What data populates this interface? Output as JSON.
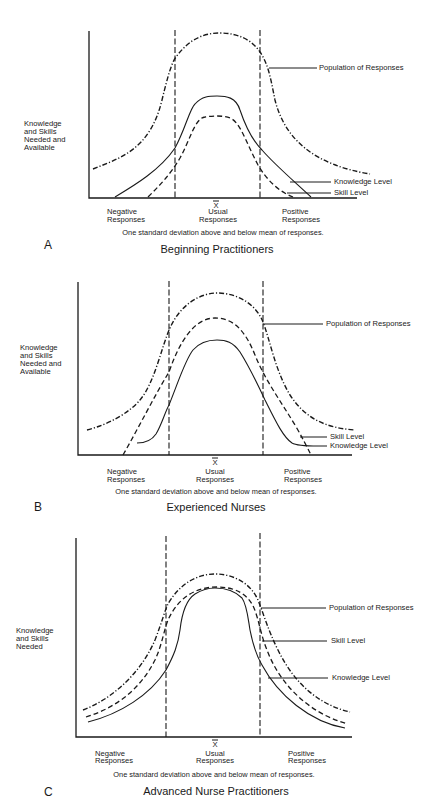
{
  "figure": {
    "panels": [
      {
        "letter": "A",
        "title": "Beginning Practitioners",
        "y_label": [
          "Knowledge",
          "and Skills",
          "Needed and",
          "Available"
        ],
        "x_labels": {
          "mean_symbol": "X",
          "negative": [
            "Negative",
            "Responses"
          ],
          "usual": [
            "Usual",
            "Responses"
          ],
          "positive": [
            "Positive",
            "Responses"
          ]
        },
        "caption": "One standard deviation above and below mean of responses.",
        "legend": {
          "population": "Population of Responses",
          "knowledge": "Knowledge Level",
          "skill": "Skill Level"
        }
      },
      {
        "letter": "B",
        "title": "Experienced Nurses",
        "y_label": [
          "Knowledge",
          "and Skills",
          "Needed and",
          "Available"
        ],
        "x_labels": {
          "mean_symbol": "X",
          "negative": [
            "Negative",
            "Responses"
          ],
          "usual": [
            "Usual",
            "Responses"
          ],
          "positive": [
            "Positive",
            "Responses"
          ]
        },
        "caption": "One standard deviation above and below mean of responses.",
        "legend": {
          "population": "Population of Responses",
          "skill": "Skill Level",
          "knowledge": "Knowledge Level"
        }
      },
      {
        "letter": "C",
        "title": "Advanced Nurse Practitioners",
        "y_label": [
          "Knowledge",
          "and Skills",
          "Needed"
        ],
        "x_labels": {
          "mean_symbol": "X",
          "negative": [
            "Negative",
            "Responses"
          ],
          "usual": [
            "Usual",
            "Responses"
          ],
          "positive": [
            "Positive",
            "Responses"
          ]
        },
        "caption": "One standard deviation above and below mean of responses.",
        "legend": {
          "population": "Population of Responses",
          "skill": "Skill Level",
          "knowledge": "Knowledge Level"
        }
      }
    ],
    "line_styles": {
      "population": "dash-dot",
      "skill": "dashed",
      "knowledge": "solid",
      "standard_deviation_markers": "dashed vertical"
    },
    "colors": {
      "ink": "#1a1a1a",
      "background": "#ffffff"
    }
  }
}
